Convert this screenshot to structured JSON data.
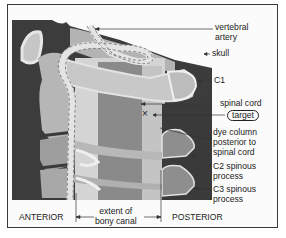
{
  "figure": {
    "labels": {
      "vertebral_artery": [
        "vertebral",
        "artery"
      ],
      "skull": "skull",
      "c1": "C1",
      "spinal_cord": "spinal cord",
      "target": "target",
      "dye_column": [
        "dye column",
        "posterior to",
        "spinal cord"
      ],
      "c2_spinous": [
        "C2 spinous",
        "process"
      ],
      "c3_spinous": [
        "C3 spinous",
        "process"
      ],
      "anterior": "ANTERIOR",
      "posterior": "POSTERIOR",
      "bony_canal": [
        "extent of",
        "bony canal"
      ]
    },
    "marker": "×",
    "colors": {
      "background": "#3c3c3c",
      "bone_light": "#c9c9c9",
      "bone_mid": "#a9a9a9",
      "bone_dark": "#8a8a8a",
      "canal_band": "#d8d8d8",
      "cord": "#777777",
      "artery_fill": "#e8e8e8",
      "frame": "#3a3a3a",
      "text": "#222222"
    }
  }
}
